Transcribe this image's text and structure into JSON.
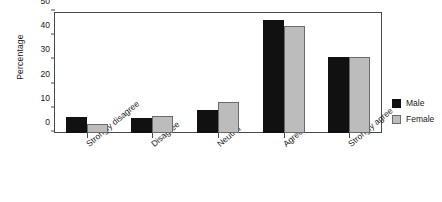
{
  "chart_data": {
    "type": "bar",
    "title": "",
    "xlabel": "",
    "ylabel": "Percentage",
    "categories": [
      "Strongly disagree",
      "Disagree",
      "Neutral",
      "Agree",
      "Strongly agree"
    ],
    "series": [
      {
        "name": "Male",
        "color": "#111111",
        "values": [
          6.6,
          6.0,
          9.5,
          46.5,
          31.5
        ]
      },
      {
        "name": "Female",
        "color": "#bcbcbc",
        "values": [
          3.6,
          7.2,
          13.0,
          44.3,
          31.5
        ]
      }
    ],
    "ylim": [
      0,
      50
    ],
    "yticks": [
      0,
      10,
      20,
      30,
      40,
      50
    ],
    "ytick_labels": [
      "0",
      "10",
      "20",
      "30",
      "40",
      "50"
    ],
    "grid": false,
    "legend_position": "right",
    "legend_entries": [
      "Male",
      "Female"
    ]
  }
}
